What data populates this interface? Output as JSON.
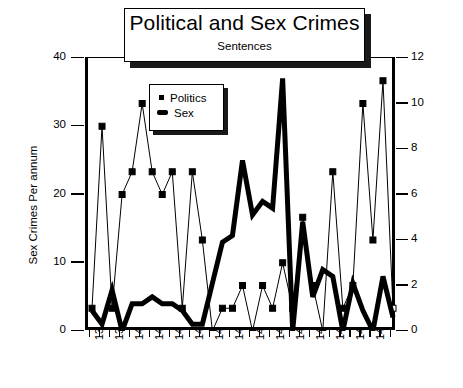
{
  "chart_data": {
    "type": "line",
    "title": "Political and Sex Crimes",
    "subtitle": "Sentences",
    "xlabel": "",
    "ylabel": "Sex Crimes\nPer annum",
    "ylabel_line1": "Sex Crimes",
    "ylabel_line2": "Per annum",
    "ylim": [
      0,
      40
    ],
    "yticks": [
      0,
      10,
      20,
      30,
      40
    ],
    "y2label": "",
    "y2lim": [
      0,
      12
    ],
    "y2ticks": [
      0,
      2,
      4,
      6,
      8,
      10,
      12
    ],
    "grid": false,
    "legend_position": "upper-left-inside",
    "x_tick_labels": [
      "1390",
      "1399",
      "1401",
      "1403",
      "1405",
      "1407",
      "1412",
      "1414",
      "1416",
      "1418",
      "1422",
      "1426",
      "1428",
      "1430",
      "1433"
    ],
    "x_index": [
      0,
      1,
      2,
      3,
      4,
      5,
      6,
      7,
      8,
      9,
      10,
      11,
      12,
      13,
      14,
      15,
      16,
      17,
      18,
      19,
      20,
      21,
      22,
      23,
      24,
      25,
      26,
      27,
      28,
      29,
      30
    ],
    "series": [
      {
        "name": "Politics",
        "axis": "right",
        "marker": "square",
        "color": "#000000",
        "line_width": 1,
        "values": [
          1,
          9,
          1,
          6,
          7,
          10,
          7,
          6,
          7,
          1,
          7,
          4,
          0,
          1,
          1,
          2,
          0,
          2,
          1,
          3,
          1,
          5,
          2,
          0,
          7,
          1,
          2,
          10,
          4,
          11,
          1
        ]
      },
      {
        "name": "Sex",
        "axis": "left",
        "marker": "none",
        "color": "#000000",
        "line_width": 5,
        "values": [
          3,
          1,
          6,
          0,
          4,
          4,
          5,
          4,
          4,
          3,
          1,
          1,
          7,
          13,
          14,
          25,
          17,
          19,
          18,
          37,
          0,
          16,
          5,
          9,
          8,
          0,
          7,
          3,
          0,
          8,
          2
        ]
      }
    ]
  },
  "legend": {
    "entries": [
      {
        "label": "Politics",
        "marker": "square"
      },
      {
        "label": "Sex",
        "marker": "thick-line"
      }
    ]
  }
}
